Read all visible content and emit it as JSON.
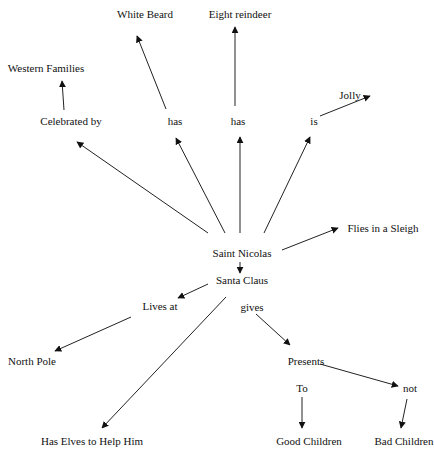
{
  "diagram": {
    "type": "concept-map",
    "stroke_color": "#222222",
    "text_color": "#111111",
    "nodes": {
      "white_beard": {
        "label": "White Beard",
        "x": 145,
        "y": 14
      },
      "eight_reindeer": {
        "label": "Eight reindeer",
        "x": 240,
        "y": 14
      },
      "western_families": {
        "label": "Western Families",
        "x": 46,
        "y": 68
      },
      "celebrated_by": {
        "label": "Celebrated by",
        "x": 71,
        "y": 121
      },
      "has_1": {
        "label": "has",
        "x": 175,
        "y": 121
      },
      "has_2": {
        "label": "has",
        "x": 238,
        "y": 121
      },
      "is": {
        "label": "is",
        "x": 314,
        "y": 121
      },
      "jolly": {
        "label": "Jolly",
        "x": 350,
        "y": 95
      },
      "flies_in_sleigh": {
        "label": "Flies in a Sleigh",
        "x": 383,
        "y": 228
      },
      "saint_nicolas": {
        "label": "Saint Nicolas",
        "x": 242,
        "y": 253
      },
      "santa_claus": {
        "label": "Santa Claus",
        "x": 242,
        "y": 280
      },
      "lives_at": {
        "label": "Lives at",
        "x": 160,
        "y": 306
      },
      "gives": {
        "label": "gives",
        "x": 252,
        "y": 307
      },
      "north_pole": {
        "label": "North Pole",
        "x": 32,
        "y": 361
      },
      "presents": {
        "label": "Presents",
        "x": 306,
        "y": 361
      },
      "to": {
        "label": "To",
        "x": 302,
        "y": 388
      },
      "not": {
        "label": "not",
        "x": 410,
        "y": 388
      },
      "has_elves": {
        "label": "Has Elves to Help Him",
        "x": 92,
        "y": 441
      },
      "good_children": {
        "label": "Good Children",
        "x": 309,
        "y": 441
      },
      "bad_children": {
        "label": "Bad Children",
        "x": 404,
        "y": 441
      }
    },
    "edges": [
      {
        "from": "saint_nicolas",
        "to": "celebrated_by",
        "x1": 208,
        "y1": 233,
        "x2": 77,
        "y2": 142
      },
      {
        "from": "celebrated_by",
        "to": "western_families",
        "x1": 64,
        "y1": 110,
        "x2": 62,
        "y2": 81
      },
      {
        "from": "saint_nicolas",
        "to": "has_1",
        "x1": 225,
        "y1": 233,
        "x2": 176,
        "y2": 138
      },
      {
        "from": "has_1",
        "to": "white_beard",
        "x1": 166,
        "y1": 109,
        "x2": 137,
        "y2": 36
      },
      {
        "from": "saint_nicolas",
        "to": "has_2",
        "x1": 240,
        "y1": 233,
        "x2": 240,
        "y2": 137
      },
      {
        "from": "has_2",
        "to": "eight_reindeer",
        "x1": 235,
        "y1": 106,
        "x2": 235,
        "y2": 27
      },
      {
        "from": "saint_nicolas",
        "to": "is",
        "x1": 264,
        "y1": 233,
        "x2": 310,
        "y2": 137
      },
      {
        "from": "is",
        "to": "jolly",
        "x1": 320,
        "y1": 116,
        "x2": 370,
        "y2": 96
      },
      {
        "from": "saint_nicolas",
        "to": "flies_in_sleigh",
        "x1": 282,
        "y1": 250,
        "x2": 338,
        "y2": 228
      },
      {
        "from": "saint_nicolas",
        "to": "santa_claus",
        "x1": 240,
        "y1": 262,
        "x2": 240,
        "y2": 273
      },
      {
        "from": "santa_claus",
        "to": "lives_at",
        "x1": 208,
        "y1": 284,
        "x2": 178,
        "y2": 298
      },
      {
        "from": "lives_at",
        "to": "north_pole",
        "x1": 131,
        "y1": 317,
        "x2": 55,
        "y2": 351
      },
      {
        "from": "santa_claus",
        "to": "has_elves",
        "x1": 226,
        "y1": 297,
        "x2": 102,
        "y2": 428
      },
      {
        "from": "gives",
        "to": "presents",
        "x1": 256,
        "y1": 314,
        "x2": 290,
        "y2": 345
      },
      {
        "from": "presents",
        "to": "not",
        "x1": 320,
        "y1": 364,
        "x2": 398,
        "y2": 386
      },
      {
        "from": "to",
        "to": "good_children",
        "x1": 302,
        "y1": 397,
        "x2": 302,
        "y2": 428
      },
      {
        "from": "not",
        "to": "bad_children",
        "x1": 407,
        "y1": 399,
        "x2": 401,
        "y2": 428
      }
    ]
  }
}
